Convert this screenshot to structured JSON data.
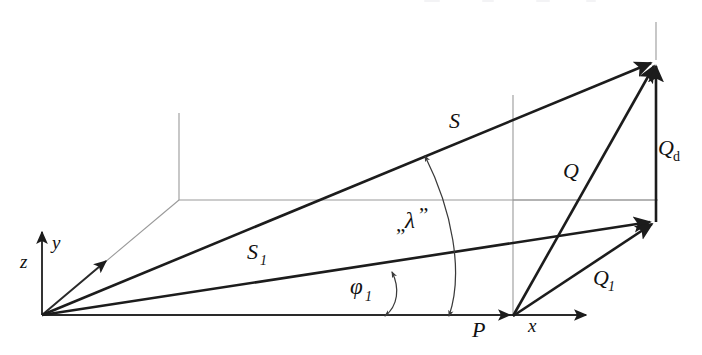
{
  "figure": {
    "type": "vector-diagram",
    "background_color": "#ffffff",
    "width": 702,
    "height": 355,
    "line_color": "#1c1c1c",
    "construction_color": "#9a9a9a"
  },
  "axes": {
    "origin_label": "",
    "z": {
      "label": "z",
      "x": 20,
      "y": 268,
      "direction": "up"
    },
    "y": {
      "label": "y",
      "x": 52,
      "y": 249,
      "direction": "upper-right-oblique"
    },
    "x": {
      "label": "x",
      "x": 528,
      "y": 332,
      "direction": "right"
    }
  },
  "points": {
    "P": {
      "label": "P",
      "x": 474,
      "y": 335
    }
  },
  "vectors": [
    {
      "name": "S",
      "label": "S",
      "label_x": 449,
      "label_y": 128,
      "from": "origin",
      "to": "top-right-apex"
    },
    {
      "name": "S1",
      "label": "S",
      "sub": "1",
      "label_x": 247,
      "label_y": 259,
      "from": "origin",
      "to": "mid-right-node"
    },
    {
      "name": "Q",
      "label": "Q",
      "label_x": 565,
      "label_y": 176,
      "from": "P",
      "to": "top-right-apex"
    },
    {
      "name": "Q1",
      "label": "Q",
      "sub": "1",
      "label_x": 595,
      "label_y": 283,
      "from": "P",
      "to": "mid-right-node"
    },
    {
      "name": "Qd",
      "label": "Q",
      "sub": "d",
      "sub_roman": true,
      "label_x": 660,
      "label_y": 155,
      "from": "mid-right-node",
      "to": "top-right-apex"
    }
  ],
  "angles": [
    {
      "name": "phi1",
      "label": "φ",
      "sub": "1",
      "label_x": 352,
      "label_y": 294,
      "description": "azimuth angle between x-axis and S1"
    },
    {
      "name": "lambda",
      "label": "λ",
      "quote_open": "„",
      "quote_close": "”",
      "label_x": 400,
      "label_y": 228,
      "description": "angle between S1 and S, double headed arc"
    }
  ],
  "labels": {
    "z": "z",
    "y": "y",
    "x": "x",
    "P": "P",
    "S": "S",
    "S1_base": "S",
    "S1_sub": "1",
    "Q": "Q",
    "Q1_base": "Q",
    "Q1_sub": "1",
    "Qd_base": "Q",
    "Qd_sub": "d",
    "phi_base": "φ",
    "phi_sub": "1",
    "lambda_open_quote": "„",
    "lambda_base": "λ",
    "lambda_close_quote": "”"
  }
}
